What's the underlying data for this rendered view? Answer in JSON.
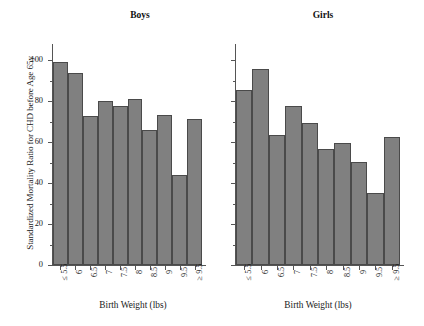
{
  "chart_data": {
    "type": "bar",
    "title": "",
    "ylabel": "Standardized Mortality Ratio for CHD before Age 65y",
    "xlabel": "Birth Weight (lbs)",
    "categories": [
      "≤ 5.5",
      "6",
      "6.5",
      "7",
      "7.5",
      "8",
      "8.5",
      "9",
      "9.5",
      "≥ 9.5"
    ],
    "ylim": [
      0,
      105
    ],
    "yticks": [
      0,
      20,
      40,
      60,
      80,
      100
    ],
    "ytick_labels": [
      "0",
      "20",
      "40",
      "60",
      "80",
      "100"
    ],
    "yticks_minor": [
      10,
      30,
      50,
      70,
      90
    ],
    "grid": false,
    "legend": "none",
    "panels": [
      {
        "title": "Boys",
        "values": [
          99,
          94,
          73,
          80,
          77.5,
          81,
          66,
          73.5,
          44,
          71.5
        ]
      },
      {
        "title": "Girls",
        "values": [
          85.5,
          95.5,
          63.5,
          77.5,
          69.5,
          56.5,
          59.5,
          50.5,
          35,
          62.5
        ]
      }
    ],
    "bar_color": "#808080",
    "bar_edge_color": "#4a4a4a"
  },
  "figure": {
    "ylabel": "Standardized Mortality Ratio for CHD before Age 65y",
    "panel_boys": {
      "title": "Boys",
      "xlabel": "Birth Weight (lbs)"
    },
    "panel_girls": {
      "title": "Girls",
      "xlabel": "Birth Weight (lbs)"
    }
  }
}
